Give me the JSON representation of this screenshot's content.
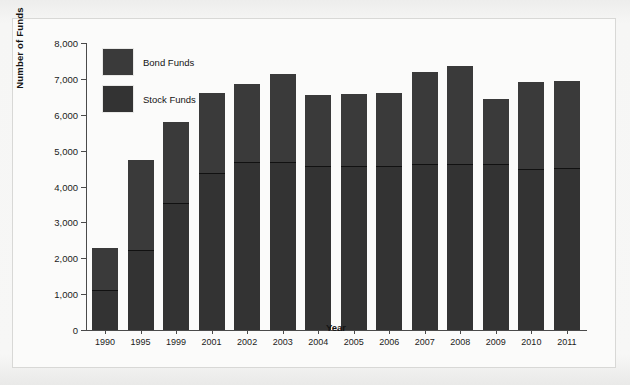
{
  "chart_data": {
    "type": "bar",
    "subtype": "stacked-column",
    "title": "",
    "xlabel": "Year",
    "ylabel": "Number of Funds",
    "categories": [
      "1990",
      "1995",
      "1999",
      "2001",
      "2002",
      "2003",
      "2004",
      "2005",
      "2006",
      "2007",
      "2008",
      "2009",
      "2010",
      "2011"
    ],
    "series": [
      {
        "name": "Stock Funds",
        "color": "#333333",
        "values": [
          1100,
          2200,
          3500,
          4350,
          4650,
          4650,
          4550,
          4550,
          4550,
          4600,
          4600,
          4600,
          4450,
          4500
        ]
      },
      {
        "name": "Bond Funds",
        "color": "#3a3a3a",
        "values": [
          1200,
          2550,
          2300,
          2250,
          2200,
          2500,
          2000,
          2030,
          2050,
          2600,
          2750,
          1850,
          2450,
          2450
        ]
      }
    ],
    "totals": [
      2300,
      4750,
      5800,
      6600,
      6850,
      7150,
      6550,
      6580,
      6600,
      7200,
      7350,
      6450,
      6900,
      6950
    ],
    "ylim": [
      0,
      8000
    ],
    "ytick_step": 1000,
    "yticks": [
      "0",
      "1,000",
      "2,000",
      "3,000",
      "4,000",
      "5,000",
      "6,000",
      "7,000",
      "8,000"
    ],
    "grid": false,
    "legend_position": "top-left"
  },
  "legend": {
    "items": [
      {
        "label": "Bond Funds",
        "color": "#3a3a3a"
      },
      {
        "label": "Stock Funds",
        "color": "#333333"
      }
    ]
  }
}
